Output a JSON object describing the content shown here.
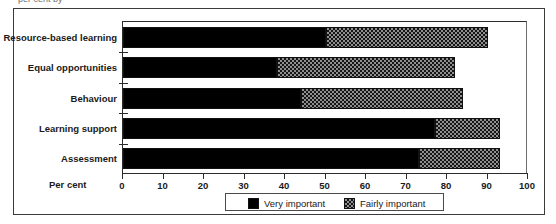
{
  "top_clipped_text": "per cent by",
  "chart_data": {
    "type": "bar",
    "orientation": "horizontal",
    "stacked": true,
    "title": "",
    "subtitle": "",
    "xlabel": "Per cent",
    "ylabel": "",
    "xlim": [
      0,
      100
    ],
    "xticks": [
      0,
      10,
      20,
      30,
      40,
      50,
      60,
      70,
      80,
      90,
      100
    ],
    "xtick_labels": [
      "0",
      "10",
      "20",
      "30",
      "40",
      "50",
      "60",
      "70",
      "80",
      "90",
      "100"
    ],
    "grid": false,
    "legend_position": "bottom",
    "categories": [
      "Resource-based learning",
      "Equal opportunities",
      "Behaviour",
      "Learning support",
      "Assessment"
    ],
    "series": [
      {
        "name": "Very important",
        "color": "#000000",
        "pattern": "solid",
        "values": [
          50,
          38,
          44,
          77,
          73
        ]
      },
      {
        "name": "Fairly important",
        "color": "#8f8f8f",
        "pattern": "checkered",
        "values": [
          40,
          44,
          40,
          16,
          20
        ]
      }
    ],
    "totals": [
      90,
      82,
      84,
      93,
      93
    ]
  },
  "legend": {
    "entries": [
      {
        "label": "Very important"
      },
      {
        "label": "Fairly important"
      }
    ]
  },
  "axis": {
    "title": "Per cent"
  },
  "colors": {
    "very_important": "#000000",
    "fairly_important": "#8f8f8f",
    "frame": "#3a3a3a",
    "axis": "#2c2c2c",
    "text": "#1a1a1a",
    "background": "#ffffff"
  }
}
